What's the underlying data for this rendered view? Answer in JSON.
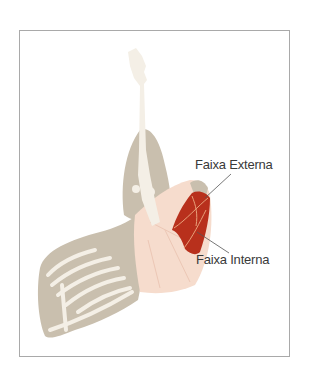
{
  "figure": {
    "labels": {
      "external": "Faixa Externa",
      "internal": "Faixa Interna"
    },
    "colors": {
      "highlight": "#b8301c",
      "bone": "#f4efe6",
      "muscle_gray": "#c9bfae",
      "meat_pink": "#f6dccd",
      "frame_border": "#a9a9a9"
    }
  }
}
